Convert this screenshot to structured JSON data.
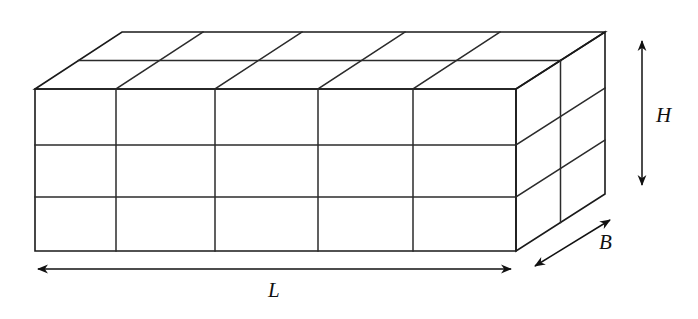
{
  "figure": {
    "name": "cuboid-grid-diagram",
    "background_color": "#ffffff",
    "line_color": "#1a1a1a"
  },
  "labels": {
    "length": "L",
    "height": "H",
    "breadth": "B"
  },
  "geometry": {
    "front_top_left": [
      35,
      89
    ],
    "front_top_right": [
      516,
      89
    ],
    "front_bottom_left": [
      35,
      251
    ],
    "front_bottom_right": [
      516,
      251
    ],
    "back_top_left": [
      122,
      32
    ],
    "back_top_right": [
      605,
      32
    ],
    "back_bottom_right": [
      605,
      194
    ],
    "divisions_length": 5,
    "divisions_height": 3,
    "divisions_breadth": 2,
    "front_column_x": [
      35,
      116,
      215,
      318,
      413,
      516
    ],
    "front_row_y": [
      89,
      145,
      197,
      251
    ]
  },
  "dimension_arrows": {
    "length_arrow": {
      "from": [
        36,
        269
      ],
      "to": [
        513,
        269
      ],
      "double_headed": true
    },
    "height_arrow": {
      "from": [
        642,
        38
      ],
      "to": [
        642,
        188
      ],
      "double_headed": true
    },
    "breadth_arrow": {
      "from": [
        532,
        268
      ],
      "to": [
        613,
        218
      ],
      "double_headed": true
    }
  }
}
